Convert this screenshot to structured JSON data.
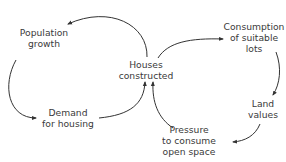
{
  "diagram": {
    "type": "causal-loop",
    "nodes": {
      "population": {
        "lines": [
          "Population",
          "growth"
        ]
      },
      "houses": {
        "lines": [
          "Houses",
          "constructed"
        ]
      },
      "consumption": {
        "lines": [
          "Consumption",
          "of suitable",
          "lots"
        ]
      },
      "land": {
        "lines": [
          "Land",
          "values"
        ]
      },
      "demand": {
        "lines": [
          "Demand",
          "for housing"
        ]
      },
      "pressure": {
        "lines": [
          "Pressure",
          "to consume",
          "open space"
        ]
      }
    },
    "edges": [
      {
        "from": "Houses constructed",
        "to": "Population growth"
      },
      {
        "from": "Population growth",
        "to": "Demand for housing"
      },
      {
        "from": "Demand for housing",
        "to": "Houses constructed"
      },
      {
        "from": "Houses constructed",
        "to": "Consumption of suitable lots"
      },
      {
        "from": "Consumption of suitable lots",
        "to": "Land values"
      },
      {
        "from": "Land values",
        "to": "Pressure to consume open space"
      },
      {
        "from": "Pressure to consume open space",
        "to": "Houses constructed"
      }
    ],
    "colors": {
      "text": "#3a3a3a",
      "arrow": "#333333",
      "background": "#ffffff"
    }
  }
}
